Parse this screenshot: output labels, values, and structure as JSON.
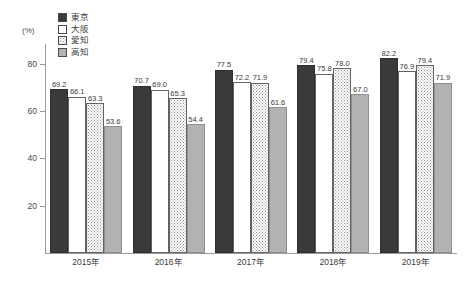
{
  "chart_data": {
    "type": "bar",
    "title": "",
    "xlabel": "",
    "ylabel": "(%)",
    "ylim": [
      0,
      90
    ],
    "yticks": [
      20,
      40,
      60,
      80
    ],
    "grid": false,
    "legend_position": "top-left",
    "categories": [
      "2015年",
      "2016年",
      "2017年",
      "2018年",
      "2019年"
    ],
    "series": [
      {
        "name": "東京",
        "fill": "solid-dark",
        "color": "#3a3a3a",
        "values": [
          69.2,
          70.7,
          77.5,
          79.4,
          82.2
        ]
      },
      {
        "name": "大阪",
        "fill": "white",
        "color": "#ffffff",
        "values": [
          66.1,
          69.0,
          72.2,
          75.8,
          76.9
        ]
      },
      {
        "name": "愛知",
        "fill": "dotted",
        "color": "#ffffff",
        "values": [
          63.3,
          65.3,
          71.9,
          78.0,
          79.4
        ]
      },
      {
        "name": "高知",
        "fill": "gray",
        "color": "#b2b2b2",
        "values": [
          53.6,
          54.4,
          61.6,
          67.0,
          71.9
        ]
      }
    ]
  },
  "axis": {
    "unit_label": "(%)",
    "tick_labels": [
      "80",
      "60",
      "40",
      "20"
    ]
  },
  "legend": {
    "items": [
      {
        "label": "東京"
      },
      {
        "label": "大阪"
      },
      {
        "label": "愛知"
      },
      {
        "label": "高知"
      }
    ]
  }
}
